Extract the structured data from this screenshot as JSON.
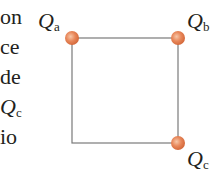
{
  "text_fragments": [
    {
      "text": "on"
    },
    {
      "text": "ce"
    },
    {
      "text": "de"
    },
    {
      "symbol": "Q",
      "sub": "c"
    },
    {
      "text": "io"
    }
  ],
  "figure": {
    "square": {
      "x": 72,
      "y": 38,
      "size": 106,
      "stroke": "#7a7a7a"
    },
    "charge_color": "#e8875a",
    "charges": [
      {
        "name": "Qa",
        "symbol": "Q",
        "sub": "a",
        "cx": 72,
        "cy": 38
      },
      {
        "name": "Qb",
        "symbol": "Q",
        "sub": "b",
        "cx": 178,
        "cy": 38
      },
      {
        "name": "Qc",
        "symbol": "Q",
        "sub": "c",
        "cx": 178,
        "cy": 143
      }
    ]
  }
}
